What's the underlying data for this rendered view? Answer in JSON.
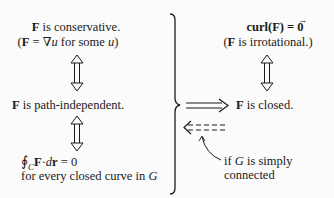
{
  "left_column": {
    "conservative": {
      "bold": "F",
      "rest": " is conservative."
    },
    "gradient": {
      "open": "(",
      "F": "F",
      "eq": " = ∇",
      "u1": "u",
      "for": " for some ",
      "u2": "u",
      "close": ")"
    },
    "path_independent": {
      "bold": "F",
      "rest": " is path-independent."
    },
    "line_integral": {
      "oint": "∮",
      "sub": "C",
      "F": "F",
      "dot": "·",
      "d": "d",
      "r": "r",
      "eq": " = 0"
    },
    "closed_curve_note": {
      "text": "for every closed curve in ",
      "G": "G"
    }
  },
  "right_column": {
    "curl": {
      "text": "curl(F) = ",
      "zero": "0"
    },
    "irrotational": {
      "open": "(",
      "F": "F",
      "rest": " is irrotational.)"
    },
    "closed": {
      "bold": "F",
      "rest": " is closed."
    },
    "simply_connected_note": {
      "if": "if ",
      "G": "G",
      "rest": " is simply",
      "line2": "connected"
    }
  },
  "arrows": {
    "left_equiv_1": "double-headed",
    "left_equiv_2": "double-headed",
    "right_equiv": "double-headed",
    "implies": "double-arrow-right",
    "converse": "dashed-double-arrow-left"
  },
  "colors": {
    "ink": "#1a1a1a",
    "background": "#fbfbfb"
  }
}
